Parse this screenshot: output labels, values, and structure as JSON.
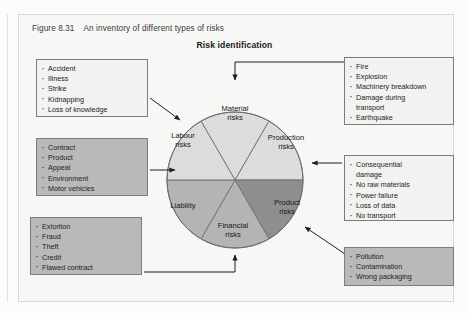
{
  "figure": {
    "number": "Figure 8.31",
    "caption": "An inventory of different types of risks",
    "title": "Risk identification"
  },
  "colors": {
    "segment_light": "#dcdcdc",
    "segment_mid": "#b4b4b4",
    "segment_dark": "#8e8e8e",
    "box_gray": "#b9b9b9",
    "box_light": "#f2f2f0",
    "stroke": "#6e6e6e",
    "page_bg": "#f7f7f5"
  },
  "chart_data": {
    "type": "pie",
    "title": "Risk identification",
    "categories": [
      "Material risks",
      "Production risks",
      "Product risks",
      "Financial risks",
      "Liability",
      "Labour risks"
    ],
    "values": [
      60,
      60,
      60,
      60,
      60,
      60
    ],
    "unit": "degrees",
    "note": "Six equal 60-degree segments of a single circle",
    "slice_colors": [
      "#dcdcdc",
      "#dcdcdc",
      "#8e8e8e",
      "#b4b4b4",
      "#b4b4b4",
      "#dcdcdc"
    ],
    "legend": "none",
    "grid": false
  },
  "segments": {
    "material": "Material\nrisks",
    "production": "Production\nrisks",
    "product": "Product\nrisks",
    "financial": "Financial\nrisks",
    "liability": "Liability",
    "labour": "Labour\nrisks"
  },
  "callouts": {
    "labour": {
      "name": "labour-risks-callout",
      "items": [
        "Accident",
        "Illness",
        "Strike",
        "Kidnapping",
        "Loss of knowledge"
      ]
    },
    "liability": {
      "name": "liability-callout",
      "items": [
        "Contract",
        "Product",
        "Appeal",
        "Environment",
        "Motor vehicles"
      ]
    },
    "financial": {
      "name": "financial-risks-callout",
      "items": [
        "Extortion",
        "Fraud",
        "Theft",
        "Credit",
        "Flawed contract"
      ]
    },
    "material": {
      "name": "material-risks-callout",
      "items": [
        "Fire",
        "Explosion",
        "Machinery breakdown",
        "Damage during\n  transport",
        "Earthquake"
      ]
    },
    "production": {
      "name": "production-risks-callout",
      "items": [
        "Consequential\n  damage",
        "No raw materials",
        "Power failure",
        "Loss of data",
        "No transport"
      ]
    },
    "product": {
      "name": "product-risks-callout",
      "items": [
        "Pollution",
        "Contamination",
        "Wrong packaging"
      ]
    }
  }
}
